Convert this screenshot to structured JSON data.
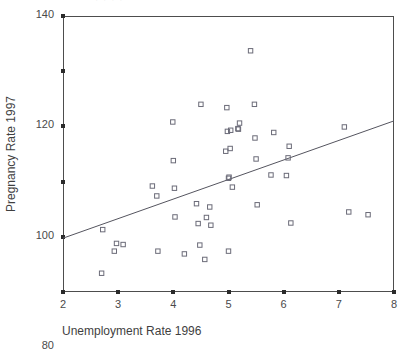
{
  "figure": {
    "top_cropped_text": "· · · ·",
    "background_color": "#ffffff",
    "marker_color": "#6b6b78",
    "line_color": "#55555f",
    "axis_color": "#4d4d4d"
  },
  "axis": {
    "y_title": "Pregnancy Rate 1997",
    "x_title": "Unemployment Rate 1996",
    "y_ticks": [
      "40",
      "60",
      "80",
      "100",
      "120",
      "140"
    ],
    "x_ticks": [
      "2",
      "3",
      "4",
      "5",
      "6",
      "7",
      "8"
    ]
  },
  "chart_data": {
    "type": "scatter",
    "title": "",
    "subtitle": "",
    "xlabel": "Unemployment Rate 1996",
    "ylabel": "Pregnancy Rate 1997",
    "xlim": [
      2,
      8
    ],
    "ylim": [
      40,
      140
    ],
    "xticks": [
      2,
      3,
      4,
      5,
      6,
      7,
      8
    ],
    "yticks": [
      40,
      60,
      80,
      100,
      120,
      140
    ],
    "grid": false,
    "legend": null,
    "marker": "open-square",
    "points": [
      [
        2.7,
        46.8
      ],
      [
        2.72,
        62.6
      ],
      [
        2.93,
        54.8
      ],
      [
        2.97,
        57.6
      ],
      [
        3.09,
        57.2
      ],
      [
        3.62,
        78.4
      ],
      [
        3.7,
        74.8
      ],
      [
        3.72,
        54.8
      ],
      [
        3.99,
        101.6
      ],
      [
        4.0,
        87.6
      ],
      [
        4.02,
        77.6
      ],
      [
        4.03,
        67.2
      ],
      [
        4.2,
        53.8
      ],
      [
        4.42,
        72.0
      ],
      [
        4.45,
        64.8
      ],
      [
        4.48,
        57.0
      ],
      [
        4.5,
        108.0
      ],
      [
        4.57,
        51.8
      ],
      [
        4.6,
        67.0
      ],
      [
        4.66,
        70.8
      ],
      [
        4.68,
        64.2
      ],
      [
        4.95,
        91.0
      ],
      [
        4.97,
        106.8
      ],
      [
        4.98,
        98.2
      ],
      [
        5.0,
        81.2
      ],
      [
        5.01,
        81.6
      ],
      [
        5.0,
        54.8
      ],
      [
        5.03,
        92.0
      ],
      [
        5.04,
        98.6
      ],
      [
        5.07,
        78.0
      ],
      [
        5.17,
        99.2
      ],
      [
        5.18,
        99.0
      ],
      [
        5.2,
        101.2
      ],
      [
        5.4,
        127.4
      ],
      [
        5.47,
        108.0
      ],
      [
        5.48,
        95.8
      ],
      [
        5.5,
        88.2
      ],
      [
        5.52,
        71.6
      ],
      [
        5.77,
        82.4
      ],
      [
        5.82,
        97.8
      ],
      [
        6.05,
        82.2
      ],
      [
        6.08,
        88.6
      ],
      [
        6.1,
        92.8
      ],
      [
        6.13,
        65.0
      ],
      [
        7.1,
        99.8
      ],
      [
        7.18,
        69.0
      ],
      [
        7.53,
        68.0
      ]
    ],
    "trendline": {
      "type": "linear",
      "x_start": 2,
      "y_start": 59.5,
      "x_end": 8,
      "y_end": 102.0
    }
  }
}
